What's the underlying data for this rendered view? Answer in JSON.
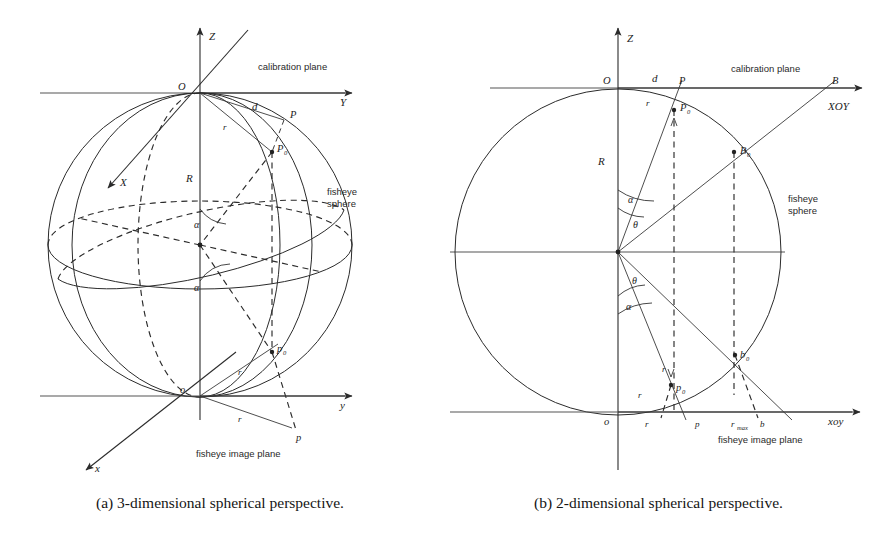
{
  "figure": {
    "type": "geometry-diagram-pair"
  },
  "panel_a": {
    "caption": "(a) 3-dimensional spherical perspective.",
    "labels": {
      "axis_z": "Z",
      "axis_y": "Y",
      "axis_x_upper": "X",
      "axis_x_lower": "x",
      "axis_y_lower": "y",
      "origin_upper": "O",
      "origin_lower": "o",
      "radius": "R",
      "dist_d": "d",
      "arc_r_upper": "r",
      "arc_r_mid": "r",
      "arc_r_lower": "r",
      "point_P": "P",
      "point_P0": "P",
      "point_P0_sub": "0",
      "point_p": "p",
      "point_p0": "p",
      "point_p0_sub": "0",
      "angle_alpha_upper": "α",
      "angle_alpha_lower": "α",
      "note_calibration": "calibration plane",
      "note_fisheye_sphere_line1": "fisheye",
      "note_fisheye_sphere_line2": "sphere",
      "note_image_plane": "fisheye image plane"
    }
  },
  "panel_b": {
    "caption": "(b) 2-dimensional spherical perspective.",
    "labels": {
      "axis_z": "Z",
      "axis_xoy_upper": "XOY",
      "axis_xoy_lower": "xoy",
      "origin_upper": "O",
      "origin_lower": "o",
      "radius": "R",
      "dist_d": "d",
      "arc_r_top": "r",
      "arc_r_bottom": "r",
      "arc_r_tick": "r",
      "axis_tick_r": "r",
      "axis_tick_p": "p",
      "axis_tick_rmax": "r",
      "axis_tick_rmax_sub": "max",
      "axis_tick_b": "b",
      "point_P": "P",
      "point_B": "B",
      "point_P0": "P",
      "point_P0_sub": "0",
      "point_B0": "B",
      "point_B0_sub": "0",
      "point_p0": "p",
      "point_p0_sub": "0",
      "point_b0": "b",
      "point_b0_sub": "0",
      "angle_alpha_upper": "α",
      "angle_theta_upper": "θ",
      "angle_theta_lower": "θ",
      "angle_alpha_lower": "α",
      "note_calibration": "calibration plane",
      "note_fisheye_sphere_line1": "fisheye",
      "note_fisheye_sphere_line2": "sphere",
      "note_image_plane": "fisheye image plane"
    }
  },
  "colors": {
    "ink": "#2b2b2b",
    "background": "#ffffff",
    "plane_gray": "#555555"
  }
}
